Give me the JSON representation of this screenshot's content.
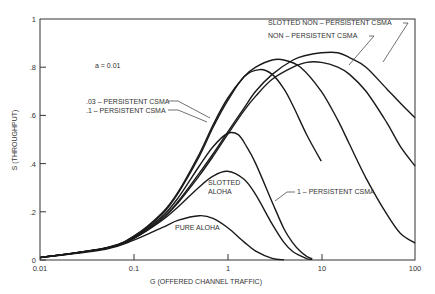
{
  "chart_data": {
    "type": "line",
    "title": "",
    "xlabel": "G (OFFERED CHANNEL TRAFFIC)",
    "ylabel": "S (THROUGHPUT)",
    "xscale": "log",
    "xlim": [
      0.01,
      100
    ],
    "ylim": [
      0,
      1
    ],
    "xticks": [
      "0.01",
      "0.1",
      "1",
      "10",
      "100"
    ],
    "yticks": [
      "0",
      ".2",
      ".4",
      ".6",
      ".8",
      "1"
    ],
    "annotation": "a = 0.01",
    "grid": false,
    "series": [
      {
        "name": "PURE ALOHA",
        "peak": {
          "G": 0.5,
          "S": 0.184
        },
        "points": [
          [
            0.01,
            0.0098
          ],
          [
            0.05,
            0.045
          ],
          [
            0.1,
            0.082
          ],
          [
            0.2,
            0.134
          ],
          [
            0.3,
            0.165
          ],
          [
            0.5,
            0.184
          ],
          [
            0.7,
            0.173
          ],
          [
            1,
            0.135
          ],
          [
            1.5,
            0.075
          ],
          [
            2,
            0.037
          ],
          [
            3,
            0.007
          ],
          [
            4,
            0.001
          ]
        ]
      },
      {
        "name": "SLOTTED ALOHA",
        "peak": {
          "G": 1,
          "S": 0.368
        },
        "points": [
          [
            0.01,
            0.0099
          ],
          [
            0.05,
            0.048
          ],
          [
            0.1,
            0.09
          ],
          [
            0.2,
            0.164
          ],
          [
            0.3,
            0.222
          ],
          [
            0.5,
            0.303
          ],
          [
            0.7,
            0.348
          ],
          [
            1,
            0.368
          ],
          [
            1.5,
            0.335
          ],
          [
            2,
            0.271
          ],
          [
            3,
            0.149
          ],
          [
            4,
            0.073
          ],
          [
            5,
            0.034
          ],
          [
            7,
            0.006
          ],
          [
            8,
            0.003
          ]
        ]
      },
      {
        "name": "1 - PERSISTENT CSMA",
        "peak": {
          "G": 1.1,
          "S": 0.53
        },
        "points": [
          [
            0.01,
            0.0099
          ],
          [
            0.05,
            0.049
          ],
          [
            0.1,
            0.095
          ],
          [
            0.2,
            0.18
          ],
          [
            0.3,
            0.26
          ],
          [
            0.5,
            0.39
          ],
          [
            0.7,
            0.47
          ],
          [
            1,
            0.525
          ],
          [
            1.3,
            0.52
          ],
          [
            1.6,
            0.47
          ],
          [
            2,
            0.4
          ],
          [
            3,
            0.24
          ],
          [
            4,
            0.13
          ],
          [
            5,
            0.07
          ],
          [
            6,
            0.035
          ],
          [
            7,
            0.015
          ],
          [
            8,
            0.005
          ]
        ]
      },
      {
        "name": ".1 - PERSISTENT CSMA",
        "peak": {
          "G": 2.2,
          "S": 0.79
        },
        "points": [
          [
            0.01,
            0.01
          ],
          [
            0.05,
            0.05
          ],
          [
            0.1,
            0.098
          ],
          [
            0.2,
            0.19
          ],
          [
            0.3,
            0.28
          ],
          [
            0.5,
            0.43
          ],
          [
            0.7,
            0.55
          ],
          [
            1,
            0.66
          ],
          [
            1.5,
            0.76
          ],
          [
            2.2,
            0.79
          ],
          [
            3,
            0.77
          ],
          [
            4,
            0.71
          ],
          [
            5,
            0.64
          ],
          [
            7,
            0.52
          ],
          [
            10,
            0.41
          ]
        ]
      },
      {
        "name": ".03 - PERSISTENT CSMA",
        "peak": {
          "G": 4,
          "S": 0.83
        },
        "points": [
          [
            0.01,
            0.01
          ],
          [
            0.05,
            0.05
          ],
          [
            0.1,
            0.099
          ],
          [
            0.2,
            0.195
          ],
          [
            0.3,
            0.285
          ],
          [
            0.5,
            0.44
          ],
          [
            0.7,
            0.56
          ],
          [
            1,
            0.67
          ],
          [
            1.5,
            0.76
          ],
          [
            2,
            0.8
          ],
          [
            3,
            0.83
          ],
          [
            4,
            0.83
          ],
          [
            6,
            0.8
          ],
          [
            10,
            0.7
          ],
          [
            15,
            0.58
          ],
          [
            20,
            0.48
          ],
          [
            30,
            0.34
          ],
          [
            50,
            0.19
          ],
          [
            70,
            0.11
          ],
          [
            100,
            0.07
          ]
        ]
      },
      {
        "name": "NON - PERSISTENT CSMA",
        "peak": {
          "G": 10,
          "S": 0.82
        },
        "points": [
          [
            0.01,
            0.0099
          ],
          [
            0.05,
            0.048
          ],
          [
            0.1,
            0.09
          ],
          [
            0.2,
            0.17
          ],
          [
            0.3,
            0.24
          ],
          [
            0.5,
            0.35
          ],
          [
            0.7,
            0.43
          ],
          [
            1,
            0.52
          ],
          [
            1.5,
            0.62
          ],
          [
            2,
            0.68
          ],
          [
            3,
            0.75
          ],
          [
            5,
            0.8
          ],
          [
            7,
            0.82
          ],
          [
            10,
            0.82
          ],
          [
            15,
            0.8
          ],
          [
            20,
            0.77
          ],
          [
            30,
            0.7
          ],
          [
            50,
            0.57
          ],
          [
            70,
            0.47
          ],
          [
            100,
            0.39
          ]
        ]
      },
      {
        "name": "SLOTTED NON - PERSISTENT CSMA",
        "peak": {
          "G": 12,
          "S": 0.86
        },
        "points": [
          [
            0.01,
            0.0099
          ],
          [
            0.05,
            0.048
          ],
          [
            0.1,
            0.091
          ],
          [
            0.2,
            0.172
          ],
          [
            0.3,
            0.245
          ],
          [
            0.5,
            0.36
          ],
          [
            0.7,
            0.44
          ],
          [
            1,
            0.53
          ],
          [
            1.5,
            0.63
          ],
          [
            2,
            0.7
          ],
          [
            3,
            0.77
          ],
          [
            5,
            0.83
          ],
          [
            7,
            0.85
          ],
          [
            10,
            0.86
          ],
          [
            15,
            0.86
          ],
          [
            20,
            0.84
          ],
          [
            30,
            0.8
          ],
          [
            50,
            0.71
          ],
          [
            70,
            0.65
          ],
          [
            100,
            0.59
          ]
        ]
      }
    ]
  },
  "labels": {
    "annotation": "a = 0.01",
    "slotted_nonpersistent": "SLOTTED NON – PERSISTENT CSMA",
    "nonpersistent": "NON – PERSISTENT CSMA",
    "p03": ".03 – PERSISTENT CSMA",
    "p1": ".1   – PERSISTENT CSMA",
    "slotted_aloha_1": "SLOTTED",
    "slotted_aloha_2": "ALOHA",
    "one_persistent": "1 – PERSISTENT CSMA",
    "pure_aloha": "PURE ALOHA",
    "xlabel": "G  (OFFERED CHANNEL TRAFFIC)",
    "ylabel": "S  (THROUGHPUT)",
    "xticks": [
      "0.01",
      "0.1",
      "1",
      "10",
      "100"
    ],
    "yticks": [
      "0",
      ".2",
      ".4",
      ".6",
      ".8",
      "1"
    ]
  }
}
